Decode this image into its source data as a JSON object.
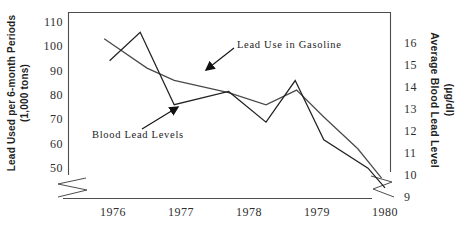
{
  "figure": {
    "background": "#ffffff",
    "axes": {
      "left": {
        "title_lines": [
          "Lead Used per 6-month Periods",
          "(1,000 tons)"
        ]
      },
      "right": {
        "title_lines": [
          "Average Blood Lead Level",
          "(µg/dl)"
        ]
      }
    },
    "annotations": [
      {
        "id": "gasoline",
        "text": "Lead Use in Gasoline"
      },
      {
        "id": "blood",
        "text": "Blood Lead Levels"
      }
    ]
  },
  "chart_data": {
    "type": "line",
    "title": "",
    "left_ylabel": "Lead Used per 6-month Periods (1,000 tons)",
    "right_ylabel": "Average Blood Lead Level (µg/dl)",
    "x_ticks": [
      1976,
      1977,
      1978,
      1979,
      1980
    ],
    "left_yticks": [
      110,
      100,
      90,
      80,
      70,
      60,
      50
    ],
    "right_yticks": [
      16,
      15,
      14,
      13,
      12,
      11,
      10,
      9
    ],
    "left_ylim": [
      50,
      110
    ],
    "right_ylim": [
      9,
      16
    ],
    "axis_break": true,
    "grid": false,
    "legend_position": "annotated-arrows",
    "series": [
      {
        "name": "Lead Use in Gasoline",
        "axis": "left",
        "color": "#4a4a4a",
        "points": [
          [
            1975.87,
            103
          ],
          [
            1976.5,
            91
          ],
          [
            1976.9,
            86
          ],
          [
            1977.7,
            81
          ],
          [
            1978.25,
            76
          ],
          [
            1978.7,
            82
          ],
          [
            1979.1,
            71
          ],
          [
            1979.6,
            58
          ],
          [
            1979.95,
            46
          ]
        ]
      },
      {
        "name": "Blood Lead Levels",
        "axis": "right",
        "color": "#222222",
        "points": [
          [
            1975.95,
            15.2
          ],
          [
            1976.4,
            16.5
          ],
          [
            1976.9,
            13.2
          ],
          [
            1977.7,
            13.8
          ],
          [
            1978.25,
            12.4
          ],
          [
            1978.68,
            14.3
          ],
          [
            1979.1,
            11.6
          ],
          [
            1979.75,
            10.3
          ],
          [
            1980,
            9.4
          ]
        ]
      }
    ]
  }
}
